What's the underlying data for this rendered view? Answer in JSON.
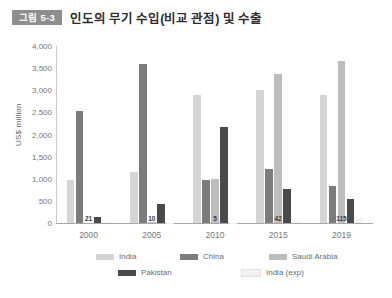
{
  "header": {
    "badge": "그림 5-3",
    "title": "인도의 무기 수입(비교 관점) 및 수출"
  },
  "chart_data": {
    "type": "bar",
    "title": "인도의 무기 수입(비교 관점) 및 수출",
    "xlabel": "",
    "ylabel": "US$ million",
    "ylim": [
      0,
      4000
    ],
    "ytick_labels": [
      "4,000",
      "3,500",
      "3,000",
      "2,500",
      "2,000",
      "1,500",
      "1,000",
      "500",
      "0"
    ],
    "ytick_values": [
      4000,
      3500,
      3000,
      2500,
      2000,
      1500,
      1000,
      500,
      0
    ],
    "grid": false,
    "legend_position": "bottom",
    "categories": [
      "2000",
      "2005",
      "2010",
      "2015",
      "2019"
    ],
    "series": [
      {
        "name": "India",
        "color": "#d5d5d5",
        "values": [
          980,
          1150,
          2900,
          3000,
          2900
        ]
      },
      {
        "name": "China",
        "color": "#7c7c7c",
        "values": [
          2530,
          3600,
          980,
          1210,
          840
        ]
      },
      {
        "name": "Saudi Arabia",
        "color": "#bdbdbd",
        "values": [
          0,
          30,
          1000,
          3370,
          3670
        ]
      },
      {
        "name": "Pakistan",
        "color": "#4a4a4a",
        "values": [
          130,
          430,
          2180,
          760,
          540
        ]
      },
      {
        "name": "India (exp)",
        "color": "#f2f2f2",
        "values": [
          21,
          10,
          5,
          42,
          115
        ]
      }
    ],
    "data_labels": [
      "21",
      "10",
      "5",
      "42",
      "115"
    ]
  },
  "legend": {
    "items": [
      {
        "label": "India"
      },
      {
        "label": "China"
      },
      {
        "label": "Saudi Arabia"
      },
      {
        "label": "Pakistan"
      },
      {
        "label": "India (exp)"
      }
    ]
  }
}
